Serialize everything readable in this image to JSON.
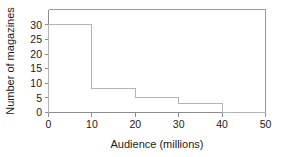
{
  "chart_data": {
    "type": "bar",
    "title": "",
    "subtitle": "",
    "xlabel": "Audience (millions)",
    "ylabel": "Number of magazines",
    "categories": [
      "0-10",
      "10-20",
      "20-30",
      "30-40",
      "40-50"
    ],
    "bin_edges": [
      0,
      10,
      20,
      30,
      40,
      50
    ],
    "values": [
      29,
      8,
      5,
      3,
      0
    ],
    "xlim": [
      0,
      50
    ],
    "ylim": [
      0,
      34
    ],
    "xticks": [
      0,
      10,
      20,
      30,
      40,
      50
    ],
    "yticks": [
      0,
      5,
      10,
      15,
      20,
      25,
      30
    ],
    "xticklabels": [
      "0",
      "10",
      "20",
      "30",
      "40",
      "50"
    ],
    "yticklabels": [
      "0",
      "5",
      "10",
      "15",
      "20",
      "25",
      "30"
    ],
    "grid": false,
    "legend": false,
    "legend_position": "none",
    "frame": "box",
    "colors": {
      "background": "#ffffff",
      "axis": "#8c8c8c",
      "frame": "#9a9a9a",
      "bar_outline": "#b4b4b4",
      "text": "#1a1a1a"
    }
  },
  "labels": {
    "x_axis_title": "Audience (millions)",
    "y_axis_title": "Number of magazines"
  }
}
